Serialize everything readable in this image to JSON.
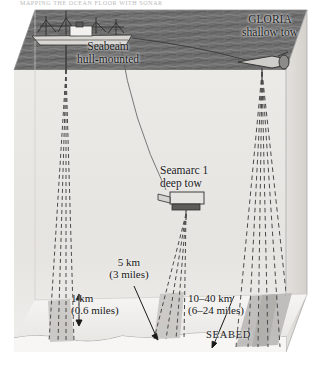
{
  "figure": {
    "clipped_header": "MAPPING THE OCEAN FLOOR WITH SONAR",
    "seabed_label": "SEABED"
  },
  "systems": [
    {
      "id": "seabeam",
      "name_line1": "Seabeam",
      "name_line2": "hull-mounted",
      "label": "Seabeam\nhull-mounted",
      "swath_km": "1 km",
      "swath_miles": "(0.6 miles)",
      "swath_label": "1 km\n(0.6 miles)"
    },
    {
      "id": "seamarc",
      "name_line1": "Seamarc 1",
      "name_line2": "deep tow",
      "label": "Seamarc 1\ndeep tow",
      "swath_km": "5 km",
      "swath_miles": "(3 miles)",
      "swath_label": "5 km\n(3 miles)"
    },
    {
      "id": "gloria",
      "name_line1": "GLORIA",
      "name_line2": "shallow tow",
      "label": "GLORIA\nshallow tow",
      "swath_km": "10–40 km",
      "swath_miles": "(6–24 miles)",
      "swath_label": "10–40 km\n(6–24 miles)"
    }
  ],
  "colors": {
    "water_surface": "#6f6f6f",
    "water_surface_dark": "#5a5a5a",
    "block_front": "#ebe9e6",
    "block_side": "#dedbd7",
    "seabed_floor": "#f4f3f1",
    "swath": "#c6c4c1",
    "beam_line": "#4a4a4a",
    "outline": "#9a9a9a",
    "ship_hull": "#d8d6d2",
    "towfish": "#cfcdc9",
    "text": "#1a1a1a",
    "page_background": "#ffffff"
  },
  "geometry": {
    "block_front_top_y": 70,
    "block_front_bottom_y": 352,
    "block_left_x": 14,
    "block_right_x": 286,
    "back_offset_x": 21,
    "back_offset_y": -60
  }
}
